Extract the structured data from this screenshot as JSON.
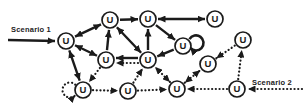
{
  "diagram": {
    "node_label": "U",
    "ink": "#1b1b1b",
    "background": "#ffffff",
    "node_radius": 8,
    "nodes": [
      {
        "id": "n1",
        "x": 66,
        "y": 41
      },
      {
        "id": "n2",
        "x": 110,
        "y": 20
      },
      {
        "id": "n3",
        "x": 148,
        "y": 19
      },
      {
        "id": "n4",
        "x": 215,
        "y": 19
      },
      {
        "id": "n5",
        "x": 183,
        "y": 46
      },
      {
        "id": "n6",
        "x": 243,
        "y": 40
      },
      {
        "id": "n7",
        "x": 106,
        "y": 60
      },
      {
        "id": "n8",
        "x": 148,
        "y": 60
      },
      {
        "id": "n9",
        "x": 208,
        "y": 64
      },
      {
        "id": "n10",
        "x": 83,
        "y": 90
      },
      {
        "id": "n11",
        "x": 128,
        "y": 91
      },
      {
        "id": "n12",
        "x": 177,
        "y": 89
      },
      {
        "id": "n13",
        "x": 237,
        "y": 89
      }
    ],
    "edges": [
      {
        "from": "n1",
        "to": "n2",
        "style": "solid",
        "heads": "both"
      },
      {
        "from": "n1",
        "to": "n7",
        "style": "solid",
        "heads": "both"
      },
      {
        "from": "n1",
        "to": "n10",
        "style": "solid",
        "heads": "both"
      },
      {
        "from": "n7",
        "to": "n2",
        "style": "solid",
        "heads": "end"
      },
      {
        "from": "n2",
        "to": "n3",
        "style": "solid",
        "heads": "end"
      },
      {
        "from": "n3",
        "to": "n4",
        "style": "solid",
        "heads": "both"
      },
      {
        "from": "n2",
        "to": "n8",
        "style": "solid",
        "heads": "both"
      },
      {
        "from": "n8",
        "to": "n3",
        "style": "solid",
        "heads": "end"
      },
      {
        "from": "n3",
        "to": "n5",
        "style": "solid",
        "heads": "end"
      },
      {
        "from": "n5",
        "to": "n8",
        "style": "solid",
        "heads": "end"
      },
      {
        "from": "n8",
        "to": "n7",
        "style": "solid",
        "heads": "end",
        "offset": [
          0,
          -2
        ]
      },
      {
        "from": "n8",
        "to": "n7",
        "style": "dotted",
        "heads": "end",
        "offset": [
          0,
          3
        ]
      },
      {
        "from": "n7",
        "to": "n10",
        "style": "dotted",
        "heads": "end"
      },
      {
        "from": "n10",
        "to": "n11",
        "style": "dotted",
        "heads": "end"
      },
      {
        "from": "n11",
        "to": "n12",
        "style": "dotted",
        "heads": "end"
      },
      {
        "from": "n11",
        "to": "n8",
        "style": "dotted",
        "heads": "end"
      },
      {
        "from": "n12",
        "to": "n8",
        "style": "dotted",
        "heads": "both"
      },
      {
        "from": "n12",
        "to": "n9",
        "style": "dotted",
        "heads": "both"
      },
      {
        "from": "n13",
        "to": "n12",
        "style": "dotted",
        "heads": "end"
      },
      {
        "from": "n13",
        "to": "n6",
        "style": "dotted",
        "heads": "end"
      },
      {
        "from": "n6",
        "to": "n9",
        "style": "dotted",
        "heads": "end"
      }
    ],
    "self_loops": [
      {
        "node": "n5",
        "style": "solid",
        "r": 7.5,
        "start": [
          6.5,
          -6.8
        ],
        "end": [
          7.3,
          1.8
        ],
        "sweep": 1
      },
      {
        "node": "n10",
        "style": "dotted",
        "r": 7.5,
        "start": [
          -7.7,
          -5.3
        ],
        "end": [
          -7.7,
          5.3
        ],
        "sweep": 0
      }
    ],
    "labels": [
      {
        "id": "scenario1",
        "text": "Scenario 1",
        "x": 31,
        "y": 29,
        "arrow": {
          "x1": 8,
          "y1": 40,
          "x2": 55,
          "y2": 41,
          "style": "solid"
        }
      },
      {
        "id": "scenario2",
        "text": "Scenario 2",
        "x": 272,
        "y": 82,
        "arrow": {
          "x1": 302,
          "y1": 89,
          "x2": 248,
          "y2": 89,
          "style": "dotted"
        }
      }
    ]
  }
}
